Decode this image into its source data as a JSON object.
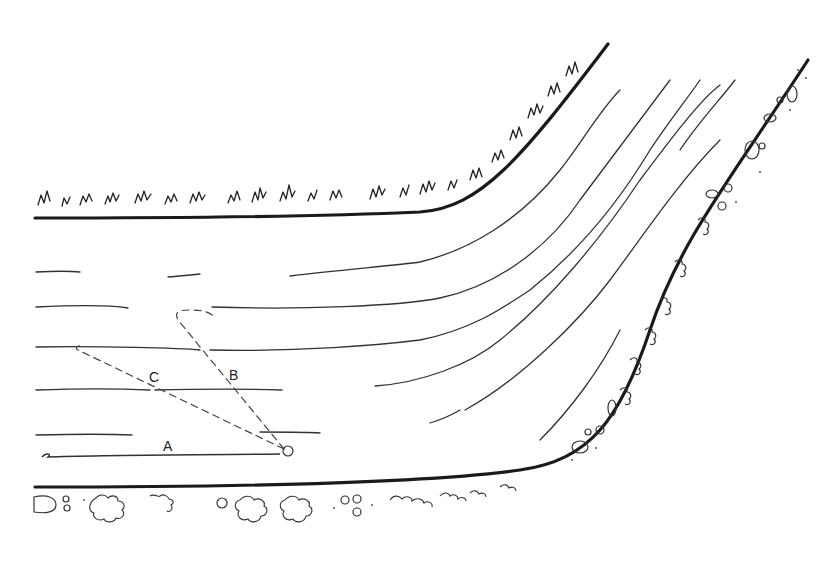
{
  "figure": {
    "labels": {
      "a": "A",
      "b": "B",
      "c": "C"
    },
    "elements": {
      "near_bank": "grassy bank (top-left / inner bend)",
      "far_bank": "stony, bushy bank (bottom / outer bend)",
      "current_lines": "flow lines curving upward to the right",
      "path_a": "straight drift line A along the lower current",
      "path_b": "dashed drift line B looping upstream",
      "path_c": "dashed drift line C angled to the left"
    },
    "colors": {
      "ink": "#1a1a1a",
      "paper": "#ffffff"
    }
  }
}
